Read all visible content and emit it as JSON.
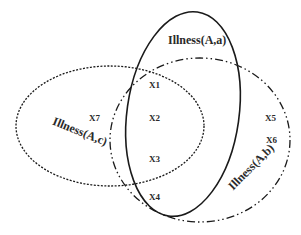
{
  "sets": [
    {
      "id": "a",
      "label": "Illness(A,a)",
      "style": "solid"
    },
    {
      "id": "b",
      "label": "Illness(A,b)",
      "style": "dash-dot"
    },
    {
      "id": "c",
      "label": "Illness(A,c)",
      "style": "dotted"
    }
  ],
  "elements": {
    "x1": "X1",
    "x2": "X2",
    "x3": "X3",
    "x4": "X4",
    "x5": "X5",
    "x6": "X6",
    "x7": "X7"
  },
  "colors": {
    "stroke": "#1a1a1a",
    "background": "#ffffff"
  }
}
